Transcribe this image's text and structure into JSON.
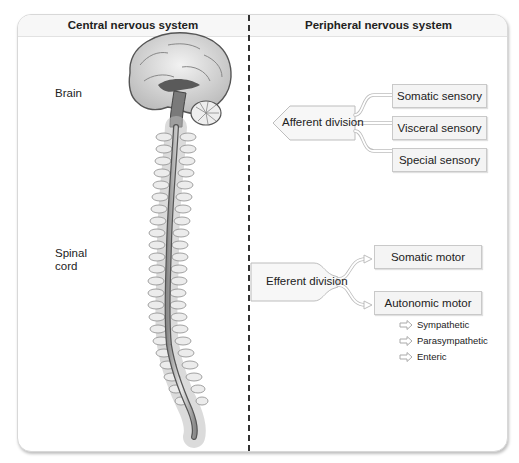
{
  "columns": {
    "left_title": "Central nervous system",
    "right_title": "Peripheral nervous system"
  },
  "cns": {
    "labels": [
      {
        "id": "brain",
        "text": "Brain"
      },
      {
        "id": "spinal_cord_line1",
        "text": "Spinal"
      },
      {
        "id": "spinal_cord_line2",
        "text": "cord"
      }
    ],
    "illustration": "brain-and-spinal-cord-illustration"
  },
  "pns": {
    "afferent": {
      "label": "Afferent division",
      "branches": [
        "Somatic sensory",
        "Visceral sensory",
        "Special sensory"
      ]
    },
    "efferent": {
      "label": "Efferent division",
      "branches": [
        "Somatic motor",
        "Autonomic motor"
      ],
      "autonomic_subdivisions": [
        "Sympathetic",
        "Parasympathetic",
        "Enteric"
      ]
    }
  },
  "colors": {
    "frame_border": "#d8d8d8",
    "header_bg": "#f7f7f7",
    "box_bg": "#f4f4f4",
    "box_border": "#c9c9c9",
    "divider": "#333333",
    "arrow_outline": "#b5b5b5"
  }
}
